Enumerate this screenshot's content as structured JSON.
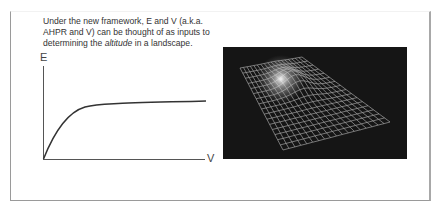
{
  "caption": {
    "line1": "Under the new framework, E and V (a.k.a.",
    "line2": "AHPR and V) can be thought of as inputs to",
    "line3_pre": "determining the ",
    "line3_em": "altitude",
    "line3_post": " in a landscape."
  },
  "chart": {
    "y_axis_label": "E",
    "x_axis_label": "V"
  },
  "landscape_image": {
    "description": "3D wireframe grid surface with a glowing peak",
    "background_color": "#151515",
    "grid_color": "#b8b8b8"
  },
  "chart_data": {
    "type": "line",
    "title": "",
    "xlabel": "V",
    "ylabel": "E",
    "series": [
      {
        "name": "E vs V",
        "x": [
          0,
          0.05,
          0.1,
          0.15,
          0.2,
          0.25,
          0.3,
          0.4,
          0.5,
          0.6,
          0.7,
          0.8,
          0.9,
          1.0
        ],
        "y": [
          0,
          0.35,
          0.6,
          0.75,
          0.83,
          0.87,
          0.88,
          0.9,
          0.91,
          0.92,
          0.93,
          0.935,
          0.94,
          0.945
        ]
      }
    ],
    "grid": false,
    "legend": "none"
  }
}
